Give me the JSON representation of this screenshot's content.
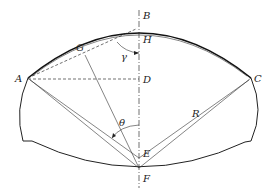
{
  "figure": {
    "type": "geometric cross-section diagram (tunnel / arch profile)",
    "points": {
      "A": "A",
      "B": "B",
      "C": "C",
      "D": "D",
      "E": "E",
      "F": "F",
      "G": "G",
      "H": "H"
    },
    "angles": {
      "gamma": "γ",
      "theta": "θ"
    },
    "radius": "R"
  }
}
